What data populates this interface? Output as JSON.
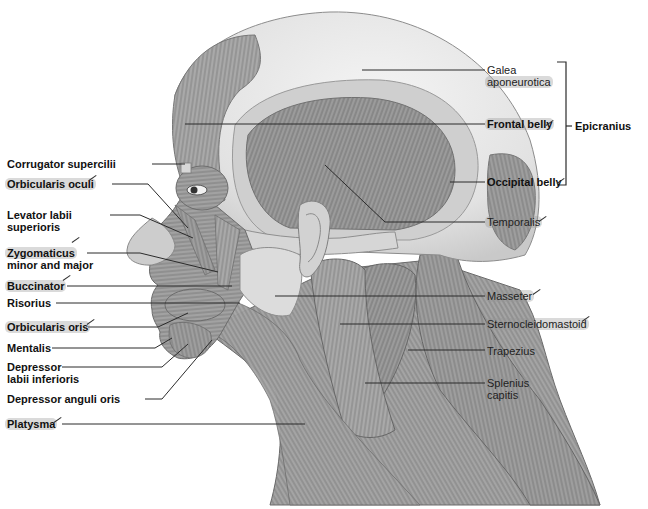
{
  "figure": {
    "type": "anatomical illustration",
    "background_color": "#ffffff",
    "label_color": "#111111",
    "leader_color": "#333333"
  },
  "labels_left": [
    {
      "id": "corrugator",
      "text": "Corrugator supercilii",
      "bold": true,
      "highlighted": false,
      "checked": false
    },
    {
      "id": "orbicularis-oculi",
      "text": "Orbicularis oculi",
      "bold": true,
      "highlighted": true,
      "checked": true
    },
    {
      "id": "levator-labii",
      "line1": "Levator labii",
      "line2": "superioris",
      "bold": true,
      "highlighted": false,
      "checked": false
    },
    {
      "id": "zygomaticus",
      "line1": "Zygomaticus",
      "line2": "minor and major",
      "bold": true,
      "highlighted": true,
      "checked": true
    },
    {
      "id": "buccinator",
      "text": "Buccinator",
      "bold": true,
      "highlighted": true,
      "checked": true
    },
    {
      "id": "risorius",
      "text": "Risorius",
      "bold": true,
      "highlighted": false,
      "checked": false
    },
    {
      "id": "orbicularis-oris",
      "text": "Orbicularis oris",
      "bold": true,
      "highlighted": true,
      "checked": true
    },
    {
      "id": "mentalis",
      "text": "Mentalis",
      "bold": true,
      "highlighted": false,
      "checked": false
    },
    {
      "id": "depressor-labii",
      "line1": "Depressor",
      "line2": "labii inferioris",
      "bold": true,
      "highlighted": false,
      "checked": false
    },
    {
      "id": "depressor-anguli",
      "text": "Depressor anguli oris",
      "bold": true,
      "highlighted": false,
      "checked": false
    },
    {
      "id": "platysma",
      "text": "Platysma",
      "bold": true,
      "highlighted": true,
      "checked": true
    }
  ],
  "labels_right": [
    {
      "id": "galea",
      "line1": "Galea",
      "line2": "aponeurotica",
      "bold": false,
      "highlighted": true,
      "checked": false
    },
    {
      "id": "frontal-belly",
      "text": "Frontal belly",
      "bold": true,
      "highlighted": true,
      "checked": true
    },
    {
      "id": "occipital-belly",
      "text": "Occipital belly",
      "bold": true,
      "highlighted": false,
      "checked": true
    },
    {
      "id": "temporalis",
      "text": "Temporalis",
      "bold": false,
      "highlighted": true,
      "checked": true
    },
    {
      "id": "masseter",
      "text": "Masseter",
      "bold": false,
      "highlighted": true,
      "checked": true
    },
    {
      "id": "sternocleidomastoid",
      "text": "Sternocleidomastoid",
      "bold": false,
      "highlighted": true,
      "checked": true
    },
    {
      "id": "trapezius",
      "text": "Trapezius",
      "bold": false,
      "highlighted": false,
      "checked": false
    },
    {
      "id": "splenius",
      "line1": "Splenius",
      "line2": "capitis",
      "bold": false,
      "highlighted": true,
      "checked": false
    }
  ],
  "group_bracket": {
    "text": "Epicranius",
    "bold": true,
    "members": [
      "Galea aponeurotica",
      "Frontal belly",
      "Occipital belly"
    ]
  }
}
